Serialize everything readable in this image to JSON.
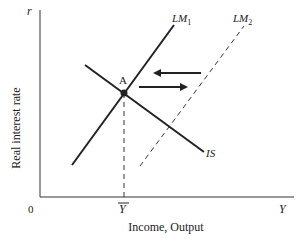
{
  "diagram": {
    "type": "IS-LM",
    "y_axis_label": "Real interest rate",
    "y_axis_symbol": "r",
    "x_axis_label": "Income, Output",
    "x_axis_symbol": "Y",
    "origin_label": "0",
    "equilibrium_output_label": "Y",
    "equilibrium_point_label": "A",
    "curves": [
      {
        "name": "LM",
        "subscript": "1",
        "style": "solid"
      },
      {
        "name": "LM",
        "subscript": "2",
        "style": "dashed"
      },
      {
        "name": "IS",
        "subscript": "",
        "style": "solid"
      }
    ],
    "arrows": [
      {
        "direction": "left"
      },
      {
        "direction": "right"
      }
    ],
    "colors": {
      "ink": "#222222",
      "axis": "#333333"
    }
  }
}
